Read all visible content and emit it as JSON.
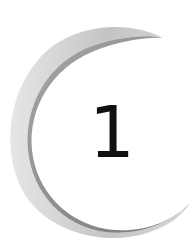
{
  "emblem": {
    "numeral": "1",
    "colors": {
      "background": "#ffffff",
      "numeral": "#111111",
      "crescent_light": "#e6e6e6",
      "crescent_mid": "#bdbdbd",
      "crescent_dark": "#5a5a5a"
    }
  }
}
